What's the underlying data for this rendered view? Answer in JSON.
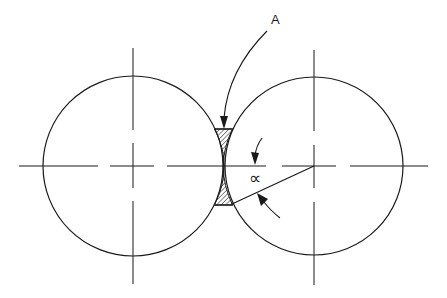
{
  "diagram": {
    "type": "two tangent rolls with nip region",
    "labels": {
      "region": "A",
      "angle": "∝"
    },
    "colors": {
      "stroke": "#1a1a1a",
      "background": "#ffffff",
      "hatch": "#1a1a1a"
    },
    "elements": [
      {
        "name": "left-circle",
        "kind": "circle",
        "center": [
          133,
          166
        ],
        "radius": 90
      },
      {
        "name": "right-circle",
        "kind": "circle",
        "center": [
          314,
          166
        ],
        "radius": 89
      },
      {
        "name": "horizontal-centerline",
        "kind": "dash-dot line",
        "from": [
          19,
          166
        ],
        "to": [
          428,
          166
        ]
      },
      {
        "name": "left-vertical-centerline",
        "kind": "dash-dot line",
        "from": [
          133,
          48
        ],
        "to": [
          133,
          284
        ]
      },
      {
        "name": "right-vertical-centerline",
        "kind": "dash-dot line",
        "from": [
          314,
          50
        ],
        "to": [
          314,
          285
        ]
      },
      {
        "name": "hatched-region-A",
        "kind": "hatched area",
        "top": 129,
        "bottom": 205,
        "left": 214,
        "right": 233
      },
      {
        "name": "angle-line",
        "kind": "line",
        "from": [
          314,
          166
        ],
        "to": [
          232,
          204
        ]
      },
      {
        "name": "leader-A",
        "kind": "curved arrow",
        "from": [
          270,
          28
        ],
        "to": [
          224,
          129
        ]
      }
    ]
  }
}
